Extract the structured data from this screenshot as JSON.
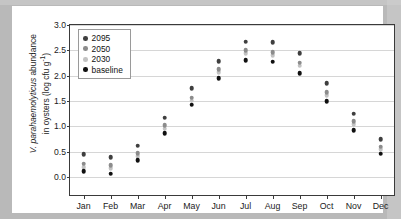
{
  "figure": {
    "y_axis_title_main": "V. parahaemolyticus abundance",
    "y_axis_title_italic": "V. parahaemolyticus",
    "y_axis_title_rest": " abundance",
    "y_axis_title_line2": "in oysters (log cfu g",
    "y_axis_title_exponent": "-1",
    "y_axis_title_close": ")"
  },
  "colors": {
    "series_2095": "#3f3f3f",
    "series_2050": "#8c8c8c",
    "series_2030": "#c2c2c2",
    "series_baseline": "#101010",
    "axis": "#3a3a3a",
    "gridline": "#d6d6d6",
    "page_background": "#b9b9b9",
    "paper": "#ffffff"
  },
  "legend": {
    "position": "top-left-inside",
    "entries": [
      {
        "label": "2095",
        "color": "#3f3f3f"
      },
      {
        "label": "2050",
        "color": "#8c8c8c"
      },
      {
        "label": "2030",
        "color": "#c2c2c2"
      },
      {
        "label": "baseline",
        "color": "#101010"
      }
    ]
  },
  "chart_data": {
    "type": "scatter",
    "title": "",
    "subtitle": "",
    "xlabel": "",
    "ylabel": "V. parahaemolyticus abundance in oysters (log cfu g-1)",
    "categories": [
      "Jan",
      "Feb",
      "Mar",
      "Apr",
      "May",
      "Jun",
      "Jul",
      "Aug",
      "Sep",
      "Oct",
      "Nov",
      "Dec"
    ],
    "ylim": [
      -0.35,
      3.0
    ],
    "yticks": [
      0.0,
      0.5,
      1.0,
      1.5,
      2.0,
      2.5,
      3.0
    ],
    "ytick_labels": [
      "0.0",
      "0.5",
      "1.0",
      "1.5",
      "2.0",
      "2.5",
      "3.0"
    ],
    "grid": "horizontal",
    "legend_position": "upper left",
    "series": [
      {
        "name": "2095",
        "color": "#3f3f3f",
        "values": [
          0.45,
          0.4,
          0.62,
          1.17,
          1.75,
          2.29,
          2.67,
          2.66,
          2.45,
          1.85,
          1.25,
          0.75
        ]
      },
      {
        "name": "2050",
        "color": "#8c8c8c",
        "values": [
          0.27,
          0.24,
          0.47,
          1.02,
          1.57,
          2.13,
          2.5,
          2.46,
          2.26,
          1.68,
          1.1,
          0.6
        ]
      },
      {
        "name": "2030",
        "color": "#c2c2c2",
        "values": [
          0.2,
          0.18,
          0.41,
          0.96,
          1.51,
          2.07,
          2.44,
          2.4,
          2.2,
          1.62,
          1.04,
          0.55
        ]
      },
      {
        "name": "baseline",
        "color": "#101010",
        "values": [
          0.12,
          0.07,
          0.33,
          0.87,
          1.43,
          1.95,
          2.31,
          2.28,
          2.05,
          1.5,
          0.93,
          0.46
        ]
      }
    ]
  }
}
